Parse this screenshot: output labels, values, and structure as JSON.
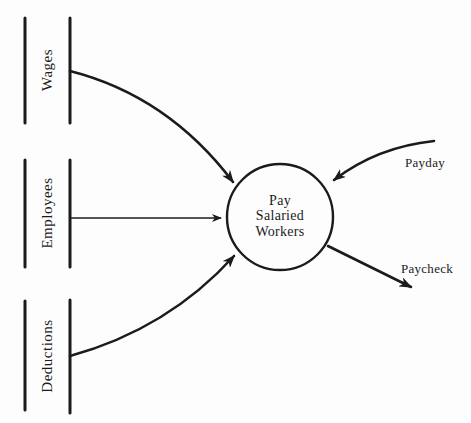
{
  "diagram": {
    "colors": {
      "ink": "#1b1b1b",
      "paper": "#fdfdfd"
    },
    "data_stores": [
      {
        "label": "Wages"
      },
      {
        "label": "Employees"
      },
      {
        "label": "Deductions"
      }
    ],
    "process": {
      "label_lines": [
        "Pay",
        "Salaried",
        "Workers"
      ]
    },
    "flows": {
      "input_label": "Payday",
      "output_label": "Paycheck"
    }
  }
}
